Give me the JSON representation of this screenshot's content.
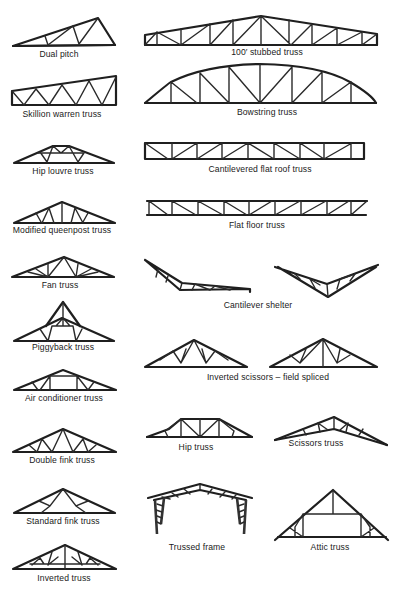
{
  "diagram": {
    "trusses": [
      {
        "id": "dual-pitch",
        "label": "Dual pitch"
      },
      {
        "id": "stubbed-100",
        "label": "100′ stubbed truss"
      },
      {
        "id": "skillion-warren",
        "label": "Skillion warren truss"
      },
      {
        "id": "bowstring",
        "label": "Bowstring truss"
      },
      {
        "id": "hip-louvre",
        "label": "Hip louvre truss"
      },
      {
        "id": "cantilevered-flat-roof",
        "label": "Cantilevered flat roof truss"
      },
      {
        "id": "modified-queenpost",
        "label": "Modified queenpost truss"
      },
      {
        "id": "flat-floor",
        "label": "Flat floor truss"
      },
      {
        "id": "fan",
        "label": "Fan truss"
      },
      {
        "id": "cantilever-shelter",
        "label": "Cantilever shelter"
      },
      {
        "id": "piggyback",
        "label": "Piggyback truss"
      },
      {
        "id": "inverted-scissors",
        "label": "Inverted scissors – field spliced"
      },
      {
        "id": "air-conditioner",
        "label": "Air conditioner truss"
      },
      {
        "id": "double-fink",
        "label": "Double fink truss"
      },
      {
        "id": "hip",
        "label": "Hip truss"
      },
      {
        "id": "scissors",
        "label": "Scissors truss"
      },
      {
        "id": "standard-fink",
        "label": "Standard fink truss"
      },
      {
        "id": "trussed-frame",
        "label": "Trussed frame"
      },
      {
        "id": "attic",
        "label": "Attic truss"
      },
      {
        "id": "inverted",
        "label": "Inverted truss"
      }
    ]
  }
}
